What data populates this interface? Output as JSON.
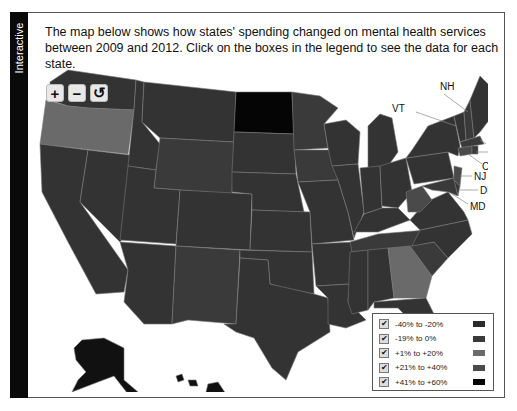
{
  "sidebar": {
    "label": "Interactive"
  },
  "intro": {
    "text": "The map below shows how states' spending changed on mental health services between 2009 and 2012. Click on the boxes in the legend to see the data for each state."
  },
  "zoom_controls": {
    "zoom_in": "+",
    "zoom_out": "−",
    "reset": "↺"
  },
  "colors": {
    "bg": "#ffffff",
    "border": "#555555",
    "sidebar": "#0a0a0a",
    "cat_neg40_neg20": "#2b2b2b",
    "cat_neg19_0": "#3a3a3a",
    "cat_pos1_pos20": "#6a6a6a",
    "cat_pos21_pos40": "#4a4a4a",
    "cat_pos41_pos60": "#050505"
  },
  "map": {
    "callouts": [
      "NH",
      "VT",
      "MA",
      "RI",
      "CT",
      "NJ",
      "DE",
      "MD"
    ]
  },
  "legend": {
    "items": [
      {
        "label": "-40% to -20%",
        "checked": true,
        "color": "#2b2b2b"
      },
      {
        "label": "-19% to 0%",
        "checked": true,
        "color": "#3a3a3a"
      },
      {
        "label": "+1% to +20%",
        "checked": true,
        "color": "#6a6a6a"
      },
      {
        "label": "+21% to +40%",
        "checked": true,
        "color": "#4a4a4a"
      },
      {
        "label": "+41% to +60%",
        "checked": true,
        "color": "#050505"
      }
    ]
  }
}
